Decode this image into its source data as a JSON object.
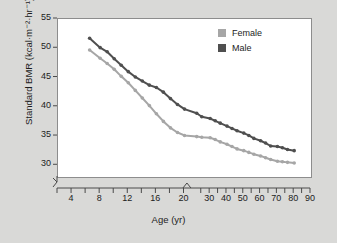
{
  "chart_data": {
    "type": "line",
    "title": "",
    "xlabel": "Age (yr)",
    "ylabel": "Standard BMR (kcal·m⁻²·hr⁻¹)",
    "ylim": [
      28,
      55
    ],
    "yticks": [
      30,
      35,
      40,
      45,
      50,
      55
    ],
    "xticks_labeled": [
      4,
      8,
      12,
      16,
      20,
      30,
      40,
      50,
      60,
      70,
      80,
      90
    ],
    "xticks_minor": [
      2,
      4,
      6,
      8,
      10,
      12,
      14,
      16,
      18,
      20,
      25,
      30,
      35,
      40,
      45,
      50,
      55,
      60,
      65,
      70,
      75,
      80,
      85,
      90
    ],
    "axis_break_x": "between 20 and 30",
    "axis_break_y": "below 30",
    "grid": false,
    "legend_position": "top-right",
    "series": [
      {
        "name": "Male",
        "color": "#4f4f4f",
        "points": [
          [
            6.5,
            51.7
          ],
          [
            8.0,
            50.1
          ],
          [
            9.0,
            49.4
          ],
          [
            10.0,
            48.2
          ],
          [
            11.0,
            47.1
          ],
          [
            12.0,
            46.0
          ],
          [
            13.0,
            45.1
          ],
          [
            14.0,
            44.4
          ],
          [
            15.0,
            43.7
          ],
          [
            16.0,
            43.3
          ],
          [
            17.0,
            42.5
          ],
          [
            18.0,
            41.4
          ],
          [
            19.0,
            40.4
          ],
          [
            20.0,
            39.6
          ],
          [
            22.0,
            38.9
          ],
          [
            25.0,
            38.3
          ],
          [
            30.0,
            38.0
          ],
          [
            33.0,
            37.6
          ],
          [
            36.0,
            37.2
          ],
          [
            40.0,
            36.7
          ],
          [
            43.0,
            36.3
          ],
          [
            46.0,
            35.9
          ],
          [
            50.0,
            35.5
          ],
          [
            53.0,
            35.1
          ],
          [
            56.0,
            34.6
          ],
          [
            60.0,
            34.2
          ],
          [
            63.0,
            33.8
          ],
          [
            66.0,
            33.3
          ],
          [
            70.0,
            33.2
          ],
          [
            73.0,
            33.0
          ],
          [
            76.0,
            32.7
          ],
          [
            80.0,
            32.5
          ]
        ]
      },
      {
        "name": "Female",
        "color": "#a6a6a6",
        "points": [
          [
            6.5,
            49.7
          ],
          [
            8.0,
            48.3
          ],
          [
            9.0,
            47.4
          ],
          [
            10.0,
            46.4
          ],
          [
            11.0,
            45.2
          ],
          [
            12.0,
            44.1
          ],
          [
            13.0,
            42.8
          ],
          [
            14.0,
            41.5
          ],
          [
            15.0,
            40.2
          ],
          [
            16.0,
            38.8
          ],
          [
            17.0,
            37.5
          ],
          [
            18.0,
            36.4
          ],
          [
            19.0,
            35.6
          ],
          [
            20.0,
            35.1
          ],
          [
            22.0,
            34.9
          ],
          [
            25.0,
            34.8
          ],
          [
            30.0,
            34.7
          ],
          [
            33.0,
            34.4
          ],
          [
            36.0,
            34.0
          ],
          [
            40.0,
            33.6
          ],
          [
            43.0,
            33.2
          ],
          [
            46.0,
            32.8
          ],
          [
            50.0,
            32.5
          ],
          [
            53.0,
            32.2
          ],
          [
            56.0,
            31.9
          ],
          [
            60.0,
            31.6
          ],
          [
            63.0,
            31.3
          ],
          [
            66.0,
            31.0
          ],
          [
            70.0,
            30.7
          ],
          [
            73.0,
            30.6
          ],
          [
            76.0,
            30.5
          ],
          [
            80.0,
            30.4
          ]
        ]
      }
    ]
  },
  "legend": {
    "items": [
      {
        "label": "Female",
        "color": "#a6a6a6"
      },
      {
        "label": "Male",
        "color": "#4f4f4f"
      }
    ]
  },
  "axes": {
    "y_title": "Standard BMR (kcal·m⁻²·hr⁻¹)",
    "x_title": "Age (yr)",
    "y_tick_labels": [
      "30",
      "35",
      "40",
      "45",
      "50",
      "55"
    ],
    "x_tick_labels": [
      "4",
      "8",
      "12",
      "16",
      "20",
      "30",
      "40",
      "50",
      "60",
      "70",
      "80",
      "90"
    ]
  },
  "colors": {
    "page_background": "#d9d9d7",
    "plot_background": "#ffffff",
    "axis": "#4a4a4a",
    "text": "#1c1c1c"
  }
}
